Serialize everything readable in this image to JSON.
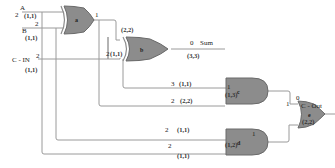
{
  "diagram": {
    "inputs": [
      {
        "name": "A",
        "fanout": "2",
        "coord": "(1,1)"
      },
      {
        "name": "B",
        "fanout": "2",
        "coord": "(1,1)"
      },
      {
        "name": "C - IN",
        "fanout": "2",
        "coord": "(1,1)"
      }
    ],
    "gates": [
      {
        "id": "a",
        "type": "XOR",
        "out_fanout": "1",
        "coord_out": "(2,2)"
      },
      {
        "id": "b",
        "type": "XOR",
        "in_fanout": "2",
        "in_coord": "(1,1)",
        "out_value": "0",
        "out_name": "Sum",
        "coord_out": "(3,3)"
      },
      {
        "id": "c",
        "type": "AND",
        "in1_fanout": "3",
        "in1_coord": "(1,1)",
        "in2_fanout": "2",
        "in2_coord": "(2,2)",
        "out_fanout": "1",
        "coord_out": "(1,3)"
      },
      {
        "id": "d",
        "type": "AND",
        "in1_fanout": "2",
        "in1_coord": "(1,1)",
        "in2_fanout": "2",
        "in2_coord": "(1,1)",
        "out_coord": "(1,2)"
      },
      {
        "id": "e",
        "type": "OR",
        "in1_fanout": "1",
        "in2_fanout": "1",
        "out_value": "0",
        "out_name": "C - Out",
        "coord_out": "(2,2)"
      }
    ]
  }
}
